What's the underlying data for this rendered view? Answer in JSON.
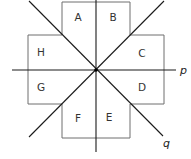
{
  "diagram": {
    "type": "geometry-reflection",
    "center": {
      "x": 96,
      "y": 70
    },
    "regions": [
      {
        "label": "A",
        "x": 78,
        "y": 21
      },
      {
        "label": "B",
        "x": 113,
        "y": 21
      },
      {
        "label": "C",
        "x": 142,
        "y": 57
      },
      {
        "label": "D",
        "x": 142,
        "y": 91
      },
      {
        "label": "E",
        "x": 109,
        "y": 121
      },
      {
        "label": "F",
        "x": 78,
        "y": 122
      },
      {
        "label": "G",
        "x": 41,
        "y": 91
      },
      {
        "label": "H",
        "x": 41,
        "y": 56
      }
    ],
    "lines": [
      {
        "name": "p",
        "label": "p",
        "orientation": "horizontal"
      },
      {
        "name": "q",
        "label": "q",
        "orientation": "diagonal-down"
      },
      {
        "name": "vertical",
        "label": "",
        "orientation": "vertical"
      },
      {
        "name": "diagonal-up",
        "label": "",
        "orientation": "diagonal-up"
      }
    ],
    "colors": {
      "outline": "#6e6e6e",
      "axis": "#1a1a1a",
      "text": "#333333"
    }
  }
}
